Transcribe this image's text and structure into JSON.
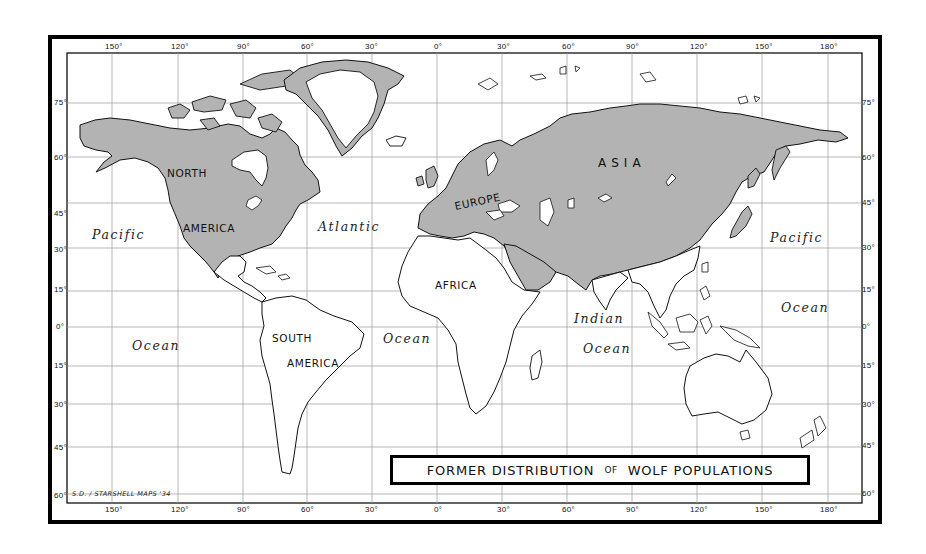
{
  "title": {
    "part1": "FORMER DISTRIBUTION",
    "part2": "OF",
    "part3": "WOLF POPULATIONS"
  },
  "credit": "S.D. / STARSHELL MAPS '34",
  "colors": {
    "wolf_range_fill": "#b3b3b3",
    "land_fill": "#ffffff",
    "outline": "#111111",
    "grid": "#9a9a9a",
    "frame": "#000000"
  },
  "longitude_ticks": [
    "150°",
    "120°",
    "90°",
    "60°",
    "30°",
    "0°",
    "30°",
    "60°",
    "90°",
    "120°",
    "150°",
    "180°"
  ],
  "latitude_ticks": [
    "75°",
    "60°",
    "45°",
    "30°",
    "15°",
    "0°",
    "15°",
    "30°",
    "45°",
    "60°"
  ],
  "continent_labels": {
    "north": "NORTH",
    "america": "AMERICA",
    "south": "SOUTH",
    "south_america": "AMERICA",
    "europe": "EUROPE",
    "asia": "A S I A",
    "africa": "AFRICA"
  },
  "ocean_labels": {
    "pacific_west": "Pacific",
    "ocean_west": "Ocean",
    "atlantic": "Atlantic",
    "atlantic_ocean": "Ocean",
    "indian": "Indian",
    "indian_ocean": "Ocean",
    "pacific_east": "Pacific",
    "ocean_east": "Ocean"
  },
  "legend": {
    "shaded_regions": [
      "North America",
      "Greenland coast",
      "Europe",
      "Asia",
      "Arabian Peninsula"
    ]
  }
}
